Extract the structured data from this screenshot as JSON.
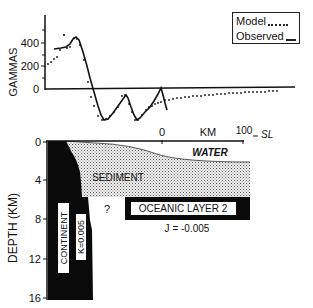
{
  "magnetic_profile": {
    "ylabel": "GAMMAS",
    "yticks": [
      "400",
      "200",
      "0"
    ],
    "legend": {
      "model_label": "Model",
      "observed_label": "Observed"
    }
  },
  "scale_bar": {
    "zero_label": "0",
    "unit_label": "KM",
    "end_label": "100",
    "sea_level_label": "SL"
  },
  "cross_section": {
    "ylabel": "DEPTH (KM)",
    "yticks": [
      "0",
      "4",
      "8",
      "12",
      "16"
    ],
    "layers": {
      "water": "WATER",
      "sediment": "SEDIMENT",
      "continent": "CONTINENT",
      "continent_k": "K=0.005",
      "oceanic": "OCEANIC LAYER 2",
      "oceanic_j": "J = -0.005",
      "unknown": "?"
    }
  },
  "colors": {
    "ink": "#111111",
    "background": "#ffffff",
    "sediment_fill": "#d8d8d8"
  }
}
